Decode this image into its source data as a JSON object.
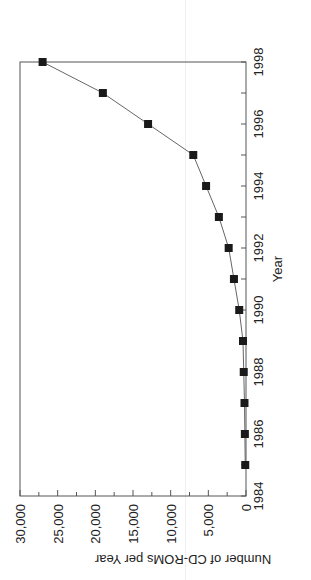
{
  "chart_data": {
    "type": "line",
    "title": "",
    "xlabel": "Year",
    "ylabel": "Number of CD-ROMs per Year",
    "x": [
      1985,
      1986,
      1987,
      1988,
      1989,
      1990,
      1991,
      1992,
      1993,
      1994,
      1995,
      1996,
      1997,
      1998
    ],
    "series": [
      {
        "name": "CD-ROMs per Year",
        "values": [
          100,
          150,
          200,
          300,
          400,
          900,
          1600,
          2300,
          3600,
          5300,
          7000,
          13000,
          19000,
          27000
        ],
        "marker": "square",
        "color": "#1a1a1a"
      }
    ],
    "xlim": [
      1984,
      1998
    ],
    "ylim": [
      0,
      30000
    ],
    "x_ticks": [
      "1984",
      "1986",
      "1988",
      "1990",
      "1992",
      "1994",
      "1996",
      "1998"
    ],
    "y_ticks": [
      "0",
      "5,000",
      "10,000",
      "15,000",
      "20,000",
      "25,000",
      "30,000"
    ],
    "grid": false,
    "orientation": "rotated 90 degrees clockwise"
  }
}
